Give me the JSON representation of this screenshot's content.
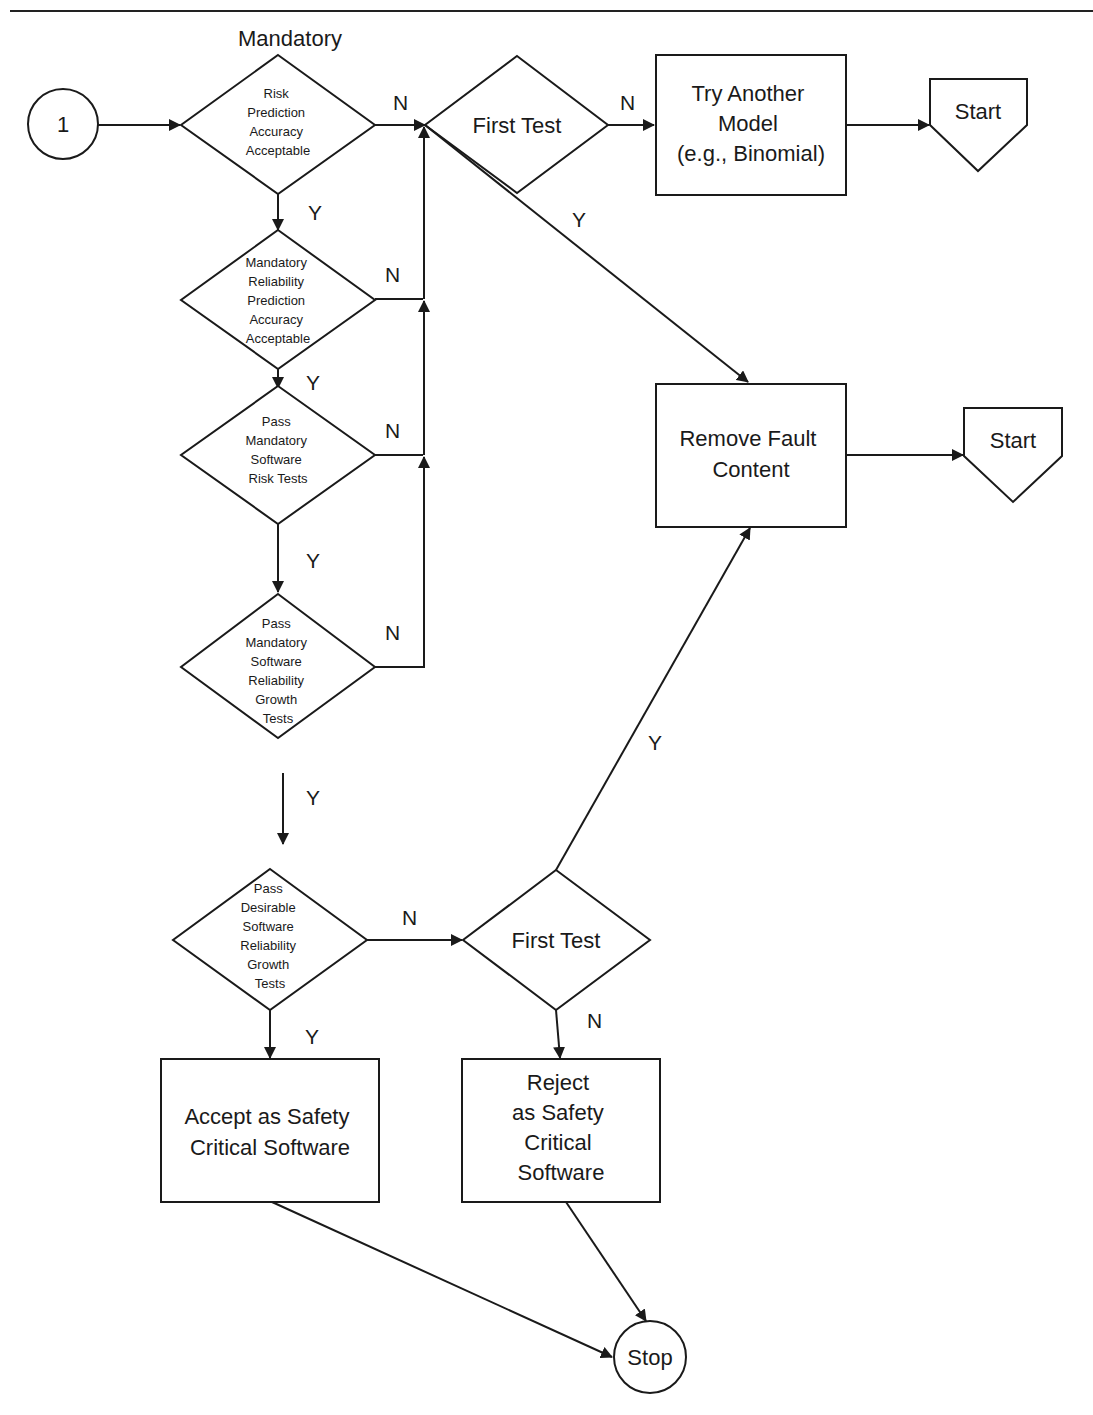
{
  "header": {
    "title": ""
  },
  "diagram": {
    "mandatory_heading": "Mandatory",
    "nodes": {
      "connector_1": {
        "label": "1"
      },
      "d_risk": {
        "lines": [
          "Risk",
          "Prediction",
          "Accuracy",
          "Acceptable"
        ]
      },
      "d_reliability": {
        "lines": [
          "Mandatory",
          "Reliability",
          "Prediction",
          "Accuracy",
          "Acceptable"
        ]
      },
      "d_risk_tests": {
        "lines": [
          "Pass",
          "Mandatory",
          "Software",
          "Risk Tests"
        ]
      },
      "d_growth_tests": {
        "lines": [
          "Pass",
          "Mandatory",
          "Software",
          "Reliability",
          "Growth",
          "Tests"
        ]
      },
      "d_desirable": {
        "lines": [
          "Pass",
          "Desirable",
          "Software",
          "Reliability",
          "Growth",
          "Tests"
        ]
      },
      "d_first_test_top": {
        "label": "First Test"
      },
      "d_first_test_bottom": {
        "label": "First Test"
      },
      "b_try_another": {
        "lines": [
          "Try Another",
          "Model",
          "(e.g., Binomial)"
        ]
      },
      "b_remove_fault": {
        "lines": [
          "Remove Fault",
          "Content"
        ]
      },
      "b_accept": {
        "lines": [
          "Accept as Safety",
          "Critical Software"
        ]
      },
      "b_reject": {
        "lines": [
          "Reject",
          "as Safety",
          "Critical",
          "Software"
        ]
      },
      "start_top": {
        "label": "Start"
      },
      "start_mid": {
        "label": "Start"
      },
      "stop": {
        "label": "Stop"
      }
    },
    "edge_labels": {
      "risk_n": "N",
      "risk_y": "Y",
      "rel_n": "N",
      "rel_y": "Y",
      "risktests_n": "N",
      "risktests_y": "Y",
      "growth_n": "N",
      "growth_y": "Y",
      "ft_top_n": "N",
      "ft_top_y": "Y",
      "desirable_n": "N",
      "desirable_y": "Y",
      "ft_bottom_n": "N",
      "ft_bottom_y": "Y"
    }
  }
}
